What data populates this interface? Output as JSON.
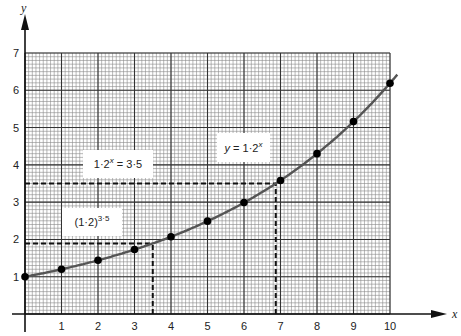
{
  "chart_data": {
    "type": "line",
    "title": "",
    "xlabel": "x",
    "ylabel": "y",
    "xlim": [
      0,
      10
    ],
    "ylim": [
      0,
      7
    ],
    "grid": true,
    "grid_minor_per_unit": 10,
    "x_ticks": [
      "1",
      "2",
      "3",
      "4",
      "5",
      "6",
      "7",
      "8",
      "9",
      "10"
    ],
    "y_ticks": [
      "1",
      "2",
      "3",
      "4",
      "5",
      "6",
      "7"
    ],
    "series": [
      {
        "name": "y = 1·2^x",
        "x": [
          0,
          1,
          2,
          3,
          4,
          5,
          6,
          7,
          8,
          9,
          10
        ],
        "values": [
          1.0,
          1.2,
          1.44,
          1.73,
          2.07,
          2.49,
          2.99,
          3.58,
          4.3,
          5.16,
          6.19
        ]
      }
    ],
    "annotations": [
      {
        "text": "y = 1·2",
        "sup": "x",
        "x": 6.2,
        "y": 4.1
      },
      {
        "text": "1·2",
        "sup": "x",
        "suffix": " = 3·5",
        "x": 1.9,
        "y": 3.85
      },
      {
        "text": "(1·2)",
        "sup": "3·5",
        "x": 1.0,
        "y": 2.2
      }
    ],
    "reference_lines": [
      {
        "type": "horizontal",
        "y": 3.5,
        "x_from": 0,
        "x_to": 6.87,
        "style": "dashed"
      },
      {
        "type": "vertical",
        "x": 6.87,
        "y_from": 0,
        "y_to": 3.5,
        "style": "dashed"
      },
      {
        "type": "horizontal",
        "y": 1.89,
        "x_from": 0,
        "x_to": 3.5,
        "style": "dashed"
      },
      {
        "type": "vertical",
        "x": 3.5,
        "y_from": 0,
        "y_to": 1.89,
        "style": "dashed"
      }
    ]
  }
}
